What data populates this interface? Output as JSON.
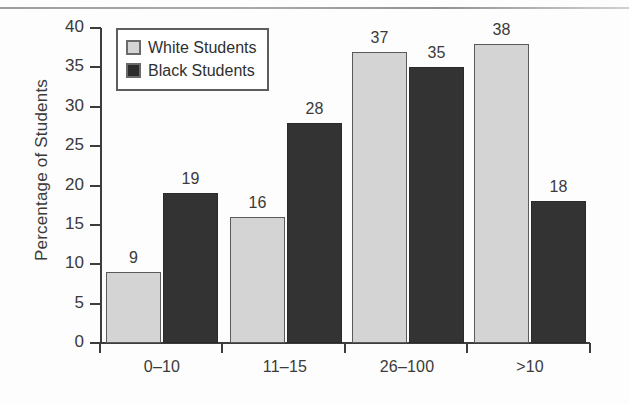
{
  "chart_data": {
    "type": "bar",
    "title": "",
    "xlabel": "",
    "ylabel": "Percentage of Students",
    "categories": [
      "0–10",
      "11–15",
      "26–100",
      ">10"
    ],
    "series": [
      {
        "name": "White Students",
        "values": [
          9,
          16,
          37,
          38
        ],
        "color": "#d4d4d4"
      },
      {
        "name": "Black Students",
        "values": [
          19,
          28,
          35,
          18
        ],
        "color": "#333333"
      }
    ],
    "ylim": [
      0,
      40
    ],
    "yticks": [
      0,
      5,
      10,
      15,
      20,
      25,
      30,
      35,
      40
    ],
    "ytick_labels": [
      "0",
      "5",
      "10",
      "15",
      "20",
      "25",
      "30",
      "35",
      "40"
    ],
    "grid": false,
    "legend_position": "upper-left-inside",
    "bar_value_labels": [
      [
        "9",
        "19"
      ],
      [
        "16",
        "28"
      ],
      [
        "37",
        "35"
      ],
      [
        "38",
        "18"
      ]
    ]
  },
  "legend": {
    "entries": [
      {
        "label": "White Students",
        "swatch": "white-swatch"
      },
      {
        "label": "Black Students",
        "swatch": "black-swatch"
      }
    ]
  }
}
